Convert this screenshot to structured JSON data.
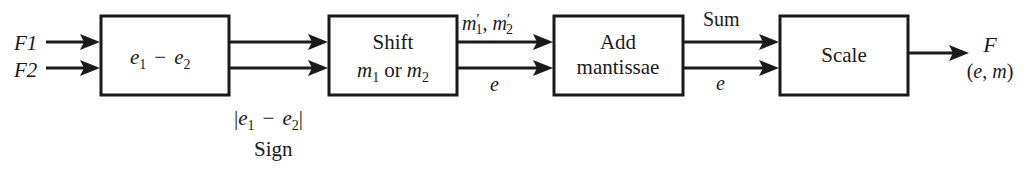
{
  "diagram": {
    "type": "block-diagram",
    "inputs": [
      {
        "id": "F1",
        "label": "F1"
      },
      {
        "id": "F2",
        "label": "F2"
      }
    ],
    "blocks": [
      {
        "id": "exp-diff",
        "label_main": "e",
        "label_full": "e1 − e2"
      },
      {
        "id": "shift",
        "line1": "Shift",
        "line2_full": "m1 or m2"
      },
      {
        "id": "add",
        "line1": "Add",
        "line2": "mantissae"
      },
      {
        "id": "scale",
        "line1": "Scale"
      }
    ],
    "edge_labels": {
      "exp_diff_out": "|e1 − e2|",
      "sign": "Sign",
      "shift_out_top": "m′1, m′2",
      "shift_out_bottom": "e",
      "add_out_top": "Sum",
      "add_out_bottom": "e",
      "output_name": "F",
      "output_sub": "(e, m)"
    },
    "text": {
      "e": "e",
      "m": "m",
      "one": "1",
      "two": "2",
      "minus": "−",
      "or": "or",
      "bar": "|",
      "prime": "′",
      "comma": ","
    },
    "colors": {
      "stroke": "#1a1a1a",
      "background": "#ffffff"
    }
  }
}
